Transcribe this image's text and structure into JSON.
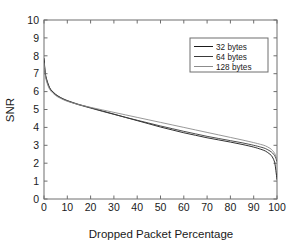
{
  "chart_data": {
    "type": "line",
    "title": "",
    "xlabel": "Dropped Packet Percentage",
    "ylabel": "SNR",
    "xlim": [
      0,
      100
    ],
    "ylim": [
      0,
      10
    ],
    "xticks": [
      0,
      10,
      20,
      30,
      40,
      50,
      60,
      70,
      80,
      90,
      100
    ],
    "yticks": [
      0,
      1,
      2,
      3,
      4,
      5,
      6,
      7,
      8,
      9,
      10
    ],
    "xtick_labels": [
      "0",
      "10",
      "20",
      "30",
      "40",
      "50",
      "60",
      "70",
      "80",
      "90",
      "100"
    ],
    "ytick_labels": [
      "0",
      "1",
      "2",
      "3",
      "4",
      "5",
      "6",
      "7",
      "8",
      "9",
      "10"
    ],
    "grid": false,
    "legend_position": "upper right",
    "legend_entries": [
      "32 bytes",
      "64 bytes",
      "128 bytes"
    ],
    "series": [
      {
        "name": "32 bytes",
        "color": "#1a1a1a",
        "x": [
          0,
          0.5,
          1,
          2,
          3,
          5,
          7,
          10,
          15,
          20,
          25,
          30,
          35,
          40,
          45,
          50,
          55,
          60,
          65,
          70,
          75,
          80,
          85,
          90,
          93,
          95,
          97,
          98,
          99,
          99.5,
          100
        ],
        "y": [
          7.85,
          7.1,
          6.75,
          6.35,
          6.1,
          5.85,
          5.68,
          5.5,
          5.28,
          5.1,
          4.92,
          4.74,
          4.56,
          4.38,
          4.2,
          4.02,
          3.86,
          3.7,
          3.56,
          3.42,
          3.3,
          3.18,
          3.05,
          2.9,
          2.78,
          2.68,
          2.5,
          2.35,
          2.05,
          1.6,
          1.1
        ]
      },
      {
        "name": "64 bytes",
        "color": "#3a3a3a",
        "x": [
          0,
          0.5,
          1,
          2,
          3,
          5,
          7,
          10,
          15,
          20,
          25,
          30,
          35,
          40,
          45,
          50,
          55,
          60,
          65,
          70,
          75,
          80,
          85,
          90,
          93,
          95,
          97,
          98,
          99,
          99.5,
          100
        ],
        "y": [
          7.75,
          7.05,
          6.7,
          6.3,
          6.08,
          5.82,
          5.66,
          5.48,
          5.26,
          5.08,
          4.9,
          4.73,
          4.56,
          4.4,
          4.24,
          4.08,
          3.93,
          3.78,
          3.64,
          3.5,
          3.38,
          3.26,
          3.14,
          3.0,
          2.9,
          2.82,
          2.68,
          2.58,
          2.42,
          2.28,
          2.1
        ]
      },
      {
        "name": "128 bytes",
        "color": "#8c8c8c",
        "x": [
          0,
          0.5,
          1,
          2,
          3,
          5,
          7,
          10,
          15,
          20,
          25,
          30,
          35,
          40,
          45,
          50,
          55,
          60,
          65,
          70,
          75,
          80,
          85,
          90,
          93,
          95,
          97,
          98,
          99,
          99.5,
          100
        ],
        "y": [
          7.6,
          6.95,
          6.62,
          6.24,
          6.02,
          5.78,
          5.63,
          5.46,
          5.27,
          5.12,
          4.98,
          4.84,
          4.7,
          4.56,
          4.42,
          4.28,
          4.14,
          4.0,
          3.86,
          3.72,
          3.58,
          3.44,
          3.3,
          3.15,
          3.05,
          2.97,
          2.83,
          2.72,
          2.55,
          2.38,
          2.2
        ]
      }
    ]
  },
  "figure": {
    "background_color": "#ffffff",
    "axis_color": "#6e6e6e"
  }
}
